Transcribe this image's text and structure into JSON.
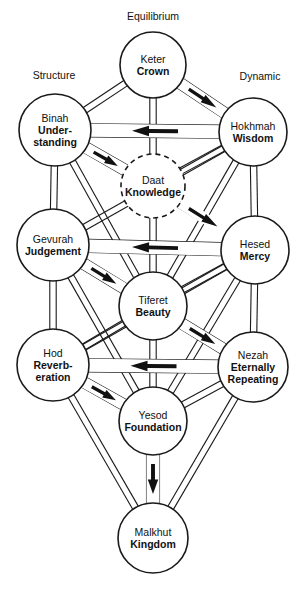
{
  "diagram": {
    "width": 307,
    "height": 591,
    "background_color": "#ffffff",
    "line_color": "#1a1a1a",
    "arrow_color": "#111111"
  },
  "pillars": [
    {
      "id": "equilibrium",
      "label": "Equilibrium",
      "x": 153,
      "y": 20
    },
    {
      "id": "structure",
      "label": "Structure",
      "x": 54,
      "y": 79
    },
    {
      "id": "dynamic",
      "label": "Dynamic",
      "x": 260,
      "y": 80
    }
  ],
  "nodes": [
    {
      "id": "keter",
      "name": "Keter",
      "meaning": "Crown",
      "meaning_lines": [
        "Crown"
      ],
      "x": 153,
      "y": 65,
      "r": 33,
      "dashed": false
    },
    {
      "id": "binah",
      "name": "Binah",
      "meaning": "Understanding",
      "meaning_lines": [
        "Under-",
        "standing"
      ],
      "x": 55,
      "y": 130,
      "r": 36,
      "dashed": false
    },
    {
      "id": "hokhmah",
      "name": "Hokhmah",
      "meaning": "Wisdom",
      "meaning_lines": [
        "Wisdom"
      ],
      "x": 253,
      "y": 132,
      "r": 34,
      "dashed": false
    },
    {
      "id": "daat",
      "name": "Daat",
      "meaning": "Knowledge",
      "meaning_lines": [
        "Knowledge"
      ],
      "x": 153,
      "y": 186,
      "r": 32,
      "dashed": true
    },
    {
      "id": "gevurah",
      "name": "Gevurah",
      "meaning": "Judgement",
      "meaning_lines": [
        "Judgement"
      ],
      "x": 53,
      "y": 245,
      "r": 36,
      "dashed": false
    },
    {
      "id": "hesed",
      "name": "Hesed",
      "meaning": "Mercy",
      "meaning_lines": [
        "Mercy"
      ],
      "x": 255,
      "y": 250,
      "r": 34,
      "dashed": false
    },
    {
      "id": "tiferet",
      "name": "Tiferet",
      "meaning": "Beauty",
      "meaning_lines": [
        "Beauty"
      ],
      "x": 153,
      "y": 306,
      "r": 34,
      "dashed": false
    },
    {
      "id": "hod",
      "name": "Hod",
      "meaning": "Reverberation",
      "meaning_lines": [
        "Reverb-",
        "eration"
      ],
      "x": 53,
      "y": 365,
      "r": 36,
      "dashed": false
    },
    {
      "id": "nezah",
      "name": "Nezah",
      "meaning": "Eternally Repeating",
      "meaning_lines": [
        "Eternally",
        "Repeating"
      ],
      "x": 253,
      "y": 367,
      "r": 35,
      "dashed": false
    },
    {
      "id": "yesod",
      "name": "Yesod",
      "meaning": "Foundation",
      "meaning_lines": [
        "Foundation"
      ],
      "x": 153,
      "y": 421,
      "r": 34,
      "dashed": false
    },
    {
      "id": "malkhut",
      "name": "Malkhut",
      "meaning": "Kingdom",
      "meaning_lines": [
        "Kingdom"
      ],
      "x": 153,
      "y": 538,
      "r": 35,
      "dashed": false
    }
  ],
  "paths": [
    {
      "from": "keter",
      "to": "binah"
    },
    {
      "from": "keter",
      "to": "hokhmah"
    },
    {
      "from": "keter",
      "to": "daat"
    },
    {
      "from": "binah",
      "to": "hokhmah"
    },
    {
      "from": "binah",
      "to": "daat"
    },
    {
      "from": "hokhmah",
      "to": "daat"
    },
    {
      "from": "binah",
      "to": "gevurah"
    },
    {
      "from": "hokhmah",
      "to": "hesed"
    },
    {
      "from": "binah",
      "to": "tiferet"
    },
    {
      "from": "hokhmah",
      "to": "tiferet"
    },
    {
      "from": "binah",
      "to": "hesed"
    },
    {
      "from": "hokhmah",
      "to": "gevurah"
    },
    {
      "from": "daat",
      "to": "tiferet"
    },
    {
      "from": "gevurah",
      "to": "hesed"
    },
    {
      "from": "gevurah",
      "to": "tiferet"
    },
    {
      "from": "hesed",
      "to": "tiferet"
    },
    {
      "from": "gevurah",
      "to": "hod"
    },
    {
      "from": "hesed",
      "to": "nezah"
    },
    {
      "from": "gevurah",
      "to": "nezah"
    },
    {
      "from": "hesed",
      "to": "hod"
    },
    {
      "from": "tiferet",
      "to": "hod"
    },
    {
      "from": "tiferet",
      "to": "nezah"
    },
    {
      "from": "tiferet",
      "to": "yesod"
    },
    {
      "from": "hod",
      "to": "nezah"
    },
    {
      "from": "hod",
      "to": "yesod"
    },
    {
      "from": "nezah",
      "to": "yesod"
    },
    {
      "from": "hod",
      "to": "malkhut"
    },
    {
      "from": "nezah",
      "to": "malkhut"
    },
    {
      "from": "yesod",
      "to": "malkhut"
    },
    {
      "from": "gevurah",
      "to": "yesod"
    },
    {
      "from": "hesed",
      "to": "yesod"
    }
  ],
  "flows": [
    {
      "id": "keter-to-hokhmah",
      "from": "keter",
      "to": "hokhmah",
      "direction": "down-right",
      "width": 11
    },
    {
      "id": "hokhmah-to-binah",
      "from": "hokhmah",
      "to": "binah",
      "direction": "left",
      "width": 13
    },
    {
      "id": "binah-to-daat",
      "from": "binah",
      "to": "daat",
      "direction": "down-right",
      "width": 11
    },
    {
      "id": "daat-to-hesed",
      "from": "daat",
      "to": "hesed",
      "direction": "down-right",
      "width": 11
    },
    {
      "id": "hesed-to-gevurah",
      "from": "hesed",
      "to": "gevurah",
      "direction": "left",
      "width": 13
    },
    {
      "id": "gevurah-to-tiferet",
      "from": "gevurah",
      "to": "tiferet",
      "direction": "down-right",
      "width": 11
    },
    {
      "id": "tiferet-to-nezah",
      "from": "tiferet",
      "to": "nezah",
      "direction": "down-right",
      "width": 11
    },
    {
      "id": "nezah-to-hod",
      "from": "nezah",
      "to": "hod",
      "direction": "left",
      "width": 13
    },
    {
      "id": "hod-to-yesod",
      "from": "hod",
      "to": "yesod",
      "direction": "down-right",
      "width": 11
    },
    {
      "id": "yesod-to-malkhut",
      "from": "yesod",
      "to": "malkhut",
      "direction": "down",
      "width": 13
    }
  ]
}
